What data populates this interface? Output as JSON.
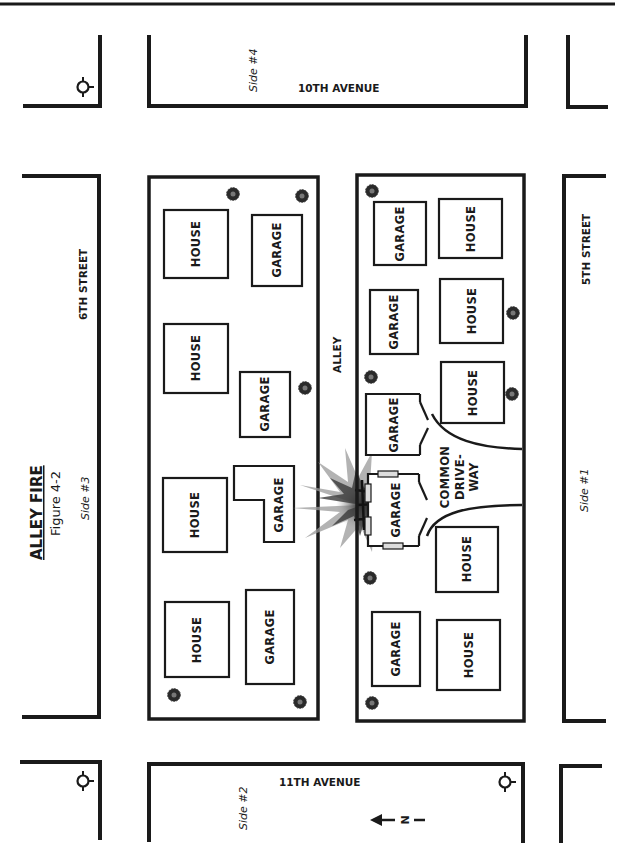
{
  "title": {
    "main": "ALLEY FIRE",
    "figure": "Figure 4-2"
  },
  "sides": {
    "side1": "Side #1",
    "side2": "Side #2",
    "side3": "Side #3",
    "side4": "Side #4"
  },
  "streets": {
    "north_avenue": "10TH AVENUE",
    "south_avenue": "11TH AVENUE",
    "west_street": "6TH STREET",
    "east_street": "5TH STREET",
    "alley": "ALLEY"
  },
  "compass": {
    "label": "N",
    "direction": "arrow-left"
  },
  "west_block": {
    "buildings": [
      {
        "type": "house",
        "label": "HOUSE"
      },
      {
        "type": "garage",
        "label": "GARAGE"
      },
      {
        "type": "house",
        "label": "HOUSE"
      },
      {
        "type": "garage",
        "label": "GARAGE"
      },
      {
        "type": "house",
        "label": "HOUSE"
      },
      {
        "type": "garage",
        "label": "GARAGE"
      },
      {
        "type": "house",
        "label": "HOUSE"
      },
      {
        "type": "garage",
        "label": "GARAGE"
      }
    ]
  },
  "east_block": {
    "buildings": [
      {
        "type": "garage",
        "label": "GARAGE"
      },
      {
        "type": "house",
        "label": "HOUSE"
      },
      {
        "type": "garage",
        "label": "GARAGE"
      },
      {
        "type": "house",
        "label": "HOUSE"
      },
      {
        "type": "garage",
        "label": "GARAGE"
      },
      {
        "type": "house",
        "label": "HOUSE"
      },
      {
        "type": "garage",
        "label": "GARAGE",
        "status": "on-fire"
      },
      {
        "type": "house",
        "label": "HOUSE"
      },
      {
        "type": "garage",
        "label": "GARAGE"
      },
      {
        "type": "house",
        "label": "HOUSE"
      }
    ],
    "driveway": {
      "line1": "COMMON",
      "line2": "DRIVE-",
      "line3": "WAY"
    }
  },
  "legend_icons": {
    "hydrant": "fire-hydrant-icon",
    "tree": "tree-icon",
    "fire": "fire-burst-icon"
  }
}
